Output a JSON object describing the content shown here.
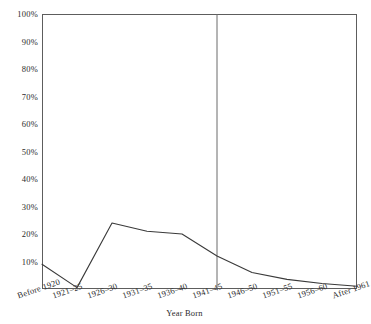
{
  "chart_data": {
    "type": "line",
    "title": "",
    "xlabel": "Year Born",
    "ylabel": "",
    "categories": [
      "Before 1920",
      "1921–25",
      "1926–30",
      "1931–35",
      "1936–40",
      "1941–45",
      "1946–50",
      "1951–55",
      "1956–60",
      "After 1961"
    ],
    "values": [
      9,
      0.5,
      24,
      21,
      20,
      12,
      6,
      3.5,
      2,
      1
    ],
    "ylim": [
      0,
      100
    ],
    "ytick_labels": [
      "10%",
      "20%",
      "30%",
      "40%",
      "50%",
      "60%",
      "70%",
      "80%",
      "90%",
      "100%"
    ],
    "ytick_values": [
      10,
      20,
      30,
      40,
      50,
      60,
      70,
      80,
      90,
      100
    ],
    "grid": false,
    "legend": null,
    "annotations": [
      {
        "name": "vertical-divider",
        "kind": "vline",
        "at_category": "1941–45",
        "value": "1941–45"
      }
    ],
    "line_color": "#3a3a3a",
    "frame_color": "#5d5d5d",
    "background": "#ffffff"
  },
  "axis": {
    "x_title": "Year Born"
  }
}
